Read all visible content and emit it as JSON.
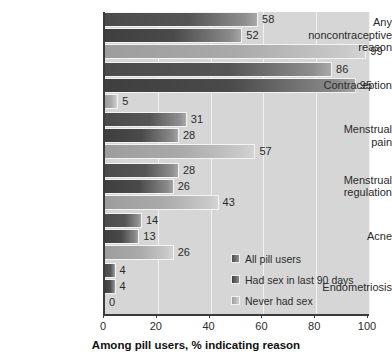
{
  "chart_data": {
    "type": "bar",
    "orientation": "horizontal",
    "title": "",
    "xlabel": "Among pill users, % indicating reason",
    "ylabel": "",
    "xlim": [
      0,
      100
    ],
    "xticks": [
      0,
      20,
      40,
      60,
      80,
      100
    ],
    "grid": true,
    "legend_position": "inside-right-lower",
    "categories": [
      "Any noncontraceptive reason",
      "Contraception",
      "Menstrual pain",
      "Menstrual regulation",
      "Acne",
      "Endometriosis"
    ],
    "series": [
      {
        "name": "All pill users",
        "color": "#4b4b4b",
        "values": [
          58,
          86,
          31,
          28,
          14,
          4
        ]
      },
      {
        "name": "Had sex in last 90 days",
        "color": "#3f3f3f",
        "values": [
          52,
          95,
          28,
          26,
          13,
          4
        ]
      },
      {
        "name": "Never had sex",
        "color": "#9d9d9d",
        "values": [
          99,
          5,
          57,
          43,
          26,
          0
        ]
      }
    ]
  },
  "category_label_lines": [
    [
      "Any",
      "noncontraceptive",
      "reason"
    ],
    [
      "Contraception"
    ],
    [
      "Menstrual",
      "pain"
    ],
    [
      "Menstrual",
      "regulation"
    ],
    [
      "Acne"
    ],
    [
      "Endometriosis"
    ]
  ],
  "axis": {
    "tick_labels": [
      "0",
      "20",
      "40",
      "60",
      "80",
      "100"
    ],
    "title": "Among pill users, % indicating reason"
  },
  "legend": {
    "items": [
      {
        "label": "All pill users"
      },
      {
        "label": "Had sex in last 90 days"
      },
      {
        "label": "Never had sex"
      }
    ]
  }
}
